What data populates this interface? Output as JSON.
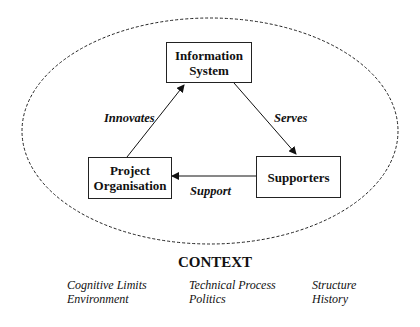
{
  "diagram": {
    "nodes": [
      {
        "id": "information-system",
        "label_line1": "Information",
        "label_line2": "System"
      },
      {
        "id": "project-organisation",
        "label_line1": "Project",
        "label_line2": "Organisation"
      },
      {
        "id": "supporters",
        "label": "Supporters"
      }
    ],
    "edges": [
      {
        "from": "project-organisation",
        "to": "information-system",
        "label": "Innovates"
      },
      {
        "from": "information-system",
        "to": "supporters",
        "label": "Serves"
      },
      {
        "from": "supporters",
        "to": "project-organisation",
        "label": "Support"
      }
    ],
    "boundary": {
      "style": "dashed ellipse"
    }
  },
  "context": {
    "title": "CONTEXT",
    "columns": [
      [
        "Cognitive Limits",
        "Environment"
      ],
      [
        "Technical Process",
        "Politics"
      ],
      [
        "Structure",
        "History"
      ]
    ]
  }
}
